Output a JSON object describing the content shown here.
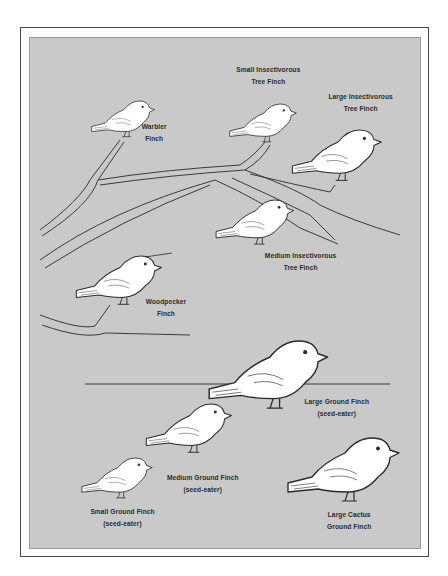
{
  "figure": {
    "colors": {
      "panel": "#c9c9c9",
      "frame": "#4a4a4a",
      "bird_fill": "#ffffff",
      "line": "#2a2a2a"
    }
  },
  "tree_finches": [
    {
      "id": "warbler",
      "line1": "Warbler",
      "line2": "Finch"
    },
    {
      "id": "small-insectivorous",
      "line1": "Small Insectivorous",
      "line2": "Tree Finch"
    },
    {
      "id": "large-insectivorous",
      "line1": "Large Insectivorous",
      "line2": "Tree Finch"
    },
    {
      "id": "medium-insectivorous",
      "line1": "Medium Insectivorous",
      "line2": "Tree Finch"
    },
    {
      "id": "woodpecker",
      "line1": "Woodpecker",
      "line2": "Finch"
    }
  ],
  "ground_finches": [
    {
      "id": "large-ground",
      "line1": "Large Ground Finch",
      "line2": "(seed-eater)"
    },
    {
      "id": "medium-ground",
      "line1": "Medium Ground Finch",
      "line2": "(seed-eater)"
    },
    {
      "id": "small-ground",
      "line1": "Small Ground Finch",
      "line2": "(seed-eater)"
    },
    {
      "id": "large-cactus-ground",
      "line1": "Large Cactus",
      "line2": "Ground Finch"
    }
  ]
}
